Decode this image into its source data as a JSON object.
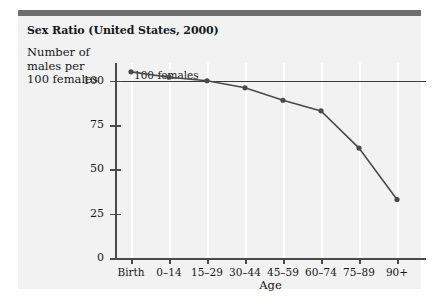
{
  "figure": {
    "title": "Sex Ratio (United States, 2000)",
    "reference_line_label": "100 females",
    "accent_color": "#6e6e6e",
    "panel_color": "#f2f2f2",
    "series_color": "#4a4a4a",
    "axis_color": "#4a4a4a",
    "gridline_color": "#ffffff"
  },
  "chart_data": {
    "type": "line",
    "title": "Sex Ratio (United States, 2000)",
    "xlabel": "Age",
    "ylabel": "Number of males per 100 females",
    "categories": [
      "Birth",
      "0–14",
      "15–29",
      "30–44",
      "45–59",
      "60–74",
      "75–89",
      "90+"
    ],
    "values": [
      105,
      102,
      100,
      96,
      89,
      83,
      62,
      33
    ],
    "ylim": [
      0,
      110
    ],
    "yticks": [
      0,
      25,
      50,
      75,
      100
    ],
    "ytick_labels": [
      "0",
      "25",
      "50",
      "75",
      "100"
    ],
    "xtick_labels": [
      "Birth",
      "0–14",
      "15–29",
      "30–44",
      "45–59",
      "60–74",
      "75–89",
      "90+"
    ],
    "grid": "vertical",
    "legend": "none",
    "annotations": [
      {
        "text": "100 females",
        "type": "reference-line",
        "y": 100
      }
    ],
    "markers": "circle"
  }
}
